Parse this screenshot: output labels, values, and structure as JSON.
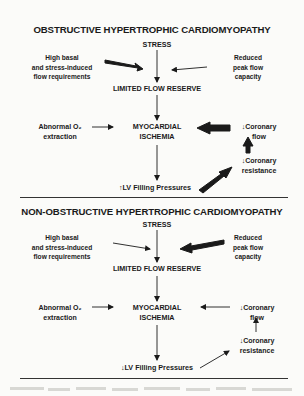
{
  "panels": [
    {
      "title": "OBSTRUCTIVE HYPERTROPHIC CARDIOMYOPATHY",
      "stress": "STRESS",
      "left_input": [
        "High basal",
        "and stress-induced",
        "flow requirements"
      ],
      "right_input": [
        "Reduced",
        "peak flow",
        "capacity"
      ],
      "limited": "LIMITED FLOW RESERVE",
      "ischemia": [
        "MYOCARDIAL",
        "ISCHEMIA"
      ],
      "o2": [
        "Abnormal O₂",
        "extraction"
      ],
      "flow": [
        "↓Coronary",
        "flow"
      ],
      "resistance": [
        "↓Coronary",
        "resistance"
      ],
      "lv": "↑LV Filling Pressures",
      "emphasis": {
        "left_input": "thick",
        "right_input": "thin",
        "flow_to_ischemia": "thick",
        "resistance_to_flow": "thick",
        "lv_to_resistance": "thick"
      }
    },
    {
      "title": "NON-OBSTRUCTIVE HYPERTROPHIC CARDIOMYOPATHY",
      "stress": "STRESS",
      "left_input": [
        "High basal",
        "and stress-induced",
        "flow requirements"
      ],
      "right_input": [
        "Reduced",
        "peak flow",
        "capacity"
      ],
      "limited": "LIMITED FLOW RESERVE",
      "ischemia": [
        "MYOCARDIAL",
        "ISCHEMIA"
      ],
      "o2": [
        "Abnormal O₂",
        "extraction"
      ],
      "flow": [
        "↓Coronary",
        "flow"
      ],
      "resistance": [
        "↓Coronary",
        "resistance"
      ],
      "lv": "↓LV Filling Pressures",
      "emphasis": {
        "left_input": "thin",
        "right_input": "thick",
        "flow_to_ischemia": "thin",
        "resistance_to_flow": "thin",
        "lv_to_resistance": "thin"
      }
    }
  ],
  "colors": {
    "ink": "#1a1a1a",
    "paper": "#fbfbf9"
  }
}
